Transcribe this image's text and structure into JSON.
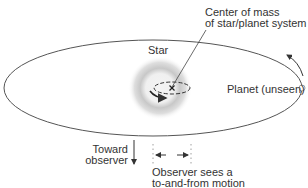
{
  "labels": {
    "center_of_mass_line1": "Center of mass",
    "center_of_mass_line2": "of star/planet system",
    "star": "Star",
    "planet": "Planet (unseen)",
    "toward_line1": "Toward",
    "toward_line2": "observer",
    "observer_line1": "Observer sees a",
    "observer_line2": "to-and-from motion"
  },
  "colors": {
    "line": "#555555",
    "text": "#333333",
    "glow": "#9a9a9a",
    "background": "#ffffff"
  },
  "icons": {
    "center_marker": "x-mark",
    "star_motion": "curved-arrow",
    "planet_motion": "curved-arrow",
    "toward_observer": "down-arrow",
    "observed_motion": "left-right-arrows"
  }
}
